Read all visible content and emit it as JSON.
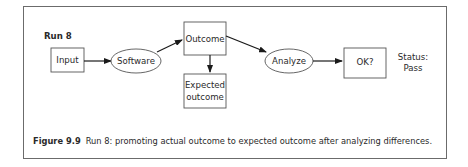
{
  "run_label": "Run 8",
  "nodes": {
    "input": "Input",
    "software": "Software",
    "outcome": "Outcome",
    "expected_line1": "Expected",
    "expected_line2": "outcome",
    "analyze": "Analyze",
    "ok": "OK?"
  },
  "status": {
    "line1": "Status:",
    "line2": "Pass"
  },
  "caption": {
    "label": "Figure 9.9",
    "text": "Run 8: promoting actual outcome to expected outcome after analyzing differences."
  }
}
